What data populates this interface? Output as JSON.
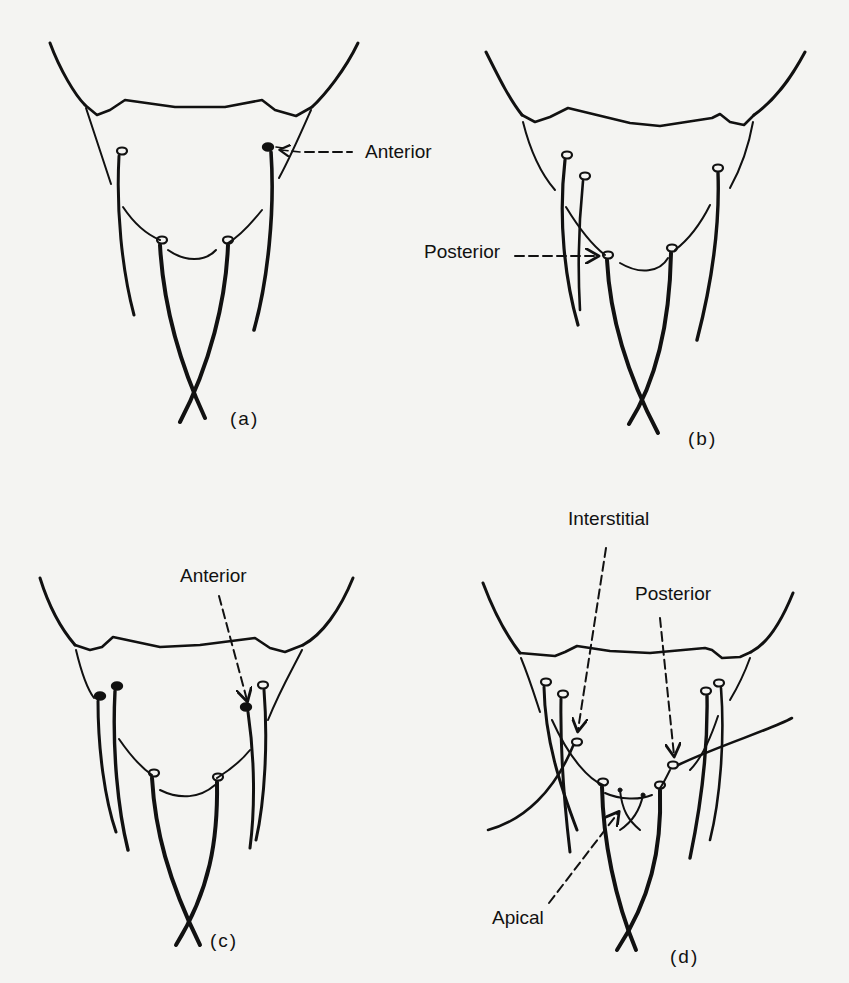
{
  "figure": {
    "panels": [
      {
        "id": "a",
        "caption": "(a)",
        "labels": [
          "Anterior"
        ]
      },
      {
        "id": "b",
        "caption": "(b)",
        "labels": [
          "Posterior"
        ]
      },
      {
        "id": "c",
        "caption": "(c)",
        "labels": [
          "Anterior"
        ]
      },
      {
        "id": "d",
        "caption": "(d)",
        "labels": [
          "Interstitial",
          "Posterior",
          "Apical"
        ]
      }
    ]
  },
  "colors": {
    "ink": "#111111",
    "paper": "#f4f4f2"
  }
}
